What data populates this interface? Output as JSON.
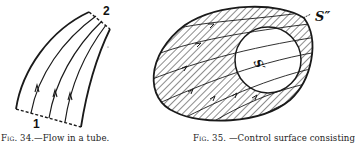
{
  "figures": [
    {
      "id": "fig34",
      "caption_prefix": "Fig. 34.",
      "caption_text": "—Flow in a tube.",
      "labels": {
        "inlet": "1",
        "outlet": "2"
      }
    },
    {
      "id": "fig35",
      "caption_prefix": "Fig. 35.",
      "caption_text": "—Control surface consisting",
      "labels": {
        "outer": "S″",
        "inner": "S′",
        "outer_leader": "←",
        "inner_leader": "←"
      }
    }
  ],
  "colors": {
    "ink": "#1a1a1a",
    "paper": "#ffffff"
  }
}
